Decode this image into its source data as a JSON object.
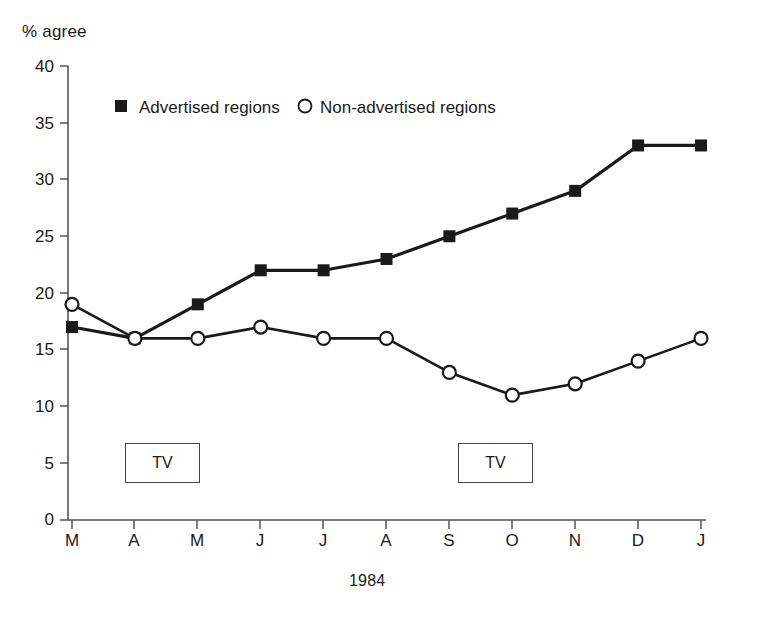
{
  "chart_data": {
    "type": "line",
    "title": "",
    "subtitle": "",
    "ylabel": "% agree",
    "xlabel": "1984",
    "categories": [
      "M",
      "A",
      "M",
      "J",
      "J",
      "A",
      "S",
      "O",
      "N",
      "D",
      "J"
    ],
    "series": [
      {
        "name": "Advertised regions",
        "marker": "filled-square",
        "values": [
          17,
          16,
          19,
          22,
          22,
          23,
          25,
          27,
          29,
          33,
          33
        ]
      },
      {
        "name": "Non-advertised regions",
        "marker": "open-circle",
        "values": [
          19,
          16,
          16,
          17,
          16,
          16,
          13,
          11,
          12,
          14,
          16
        ]
      }
    ],
    "ylim": [
      0,
      40
    ],
    "yticks": [
      0,
      5,
      10,
      15,
      20,
      25,
      30,
      35,
      40
    ],
    "ytick_labels": [
      "0",
      "5",
      "10",
      "15",
      "20",
      "25",
      "30",
      "35",
      "40"
    ],
    "grid": false,
    "legend_position": "top-left-inside",
    "annotations": [
      {
        "label": "TV",
        "x_category_index": 1,
        "y_value": 5
      },
      {
        "label": "TV",
        "x_category_index": 6,
        "y_value": 5
      }
    ],
    "colors": {
      "line": "#1a1a1a",
      "marker_fill_advertised": "#1a1a1a",
      "marker_fill_nonadvertised": "#ffffff",
      "axis": "#555555",
      "background": "#ffffff"
    }
  },
  "legend": {
    "entries": [
      {
        "label": "Advertised regions",
        "marker": "filled-square-marker"
      },
      {
        "label": "Non-advertised regions",
        "marker": "open-circle-marker"
      }
    ]
  },
  "annotations": {
    "tv_first": "TV",
    "tv_second": "TV"
  }
}
